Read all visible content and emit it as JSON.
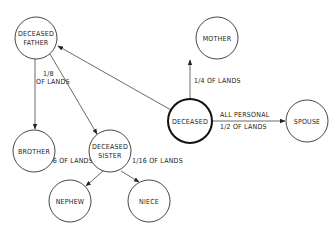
{
  "nodes": {
    "deceased_father": {
      "line1": "DECEASED",
      "line2": "FATHER"
    },
    "mother": {
      "label": "MOTHER"
    },
    "deceased": {
      "label": "DECEASED"
    },
    "spouse": {
      "label": "SPOUSE"
    },
    "brother": {
      "label": "BROTHER"
    },
    "deceased_sister": {
      "line1": "DECEASED",
      "line2": "SISTER"
    },
    "nephew": {
      "label": "NEPHEW"
    },
    "niece": {
      "label": "NIECE"
    }
  },
  "edges": {
    "father_to_brother": {
      "line1": "1/8",
      "line2": "OF LANDS"
    },
    "deceased_to_mother": {
      "label": "1/4 OF LANDS"
    },
    "deceased_to_spouse": {
      "line1": "ALL PERSONAL",
      "line2": "1/2 OF LANDS"
    },
    "sister_to_nephew": {
      "label": "1/16 OF LANDS"
    },
    "sister_to_niece": {
      "label": "1/16 OF LANDS"
    }
  }
}
